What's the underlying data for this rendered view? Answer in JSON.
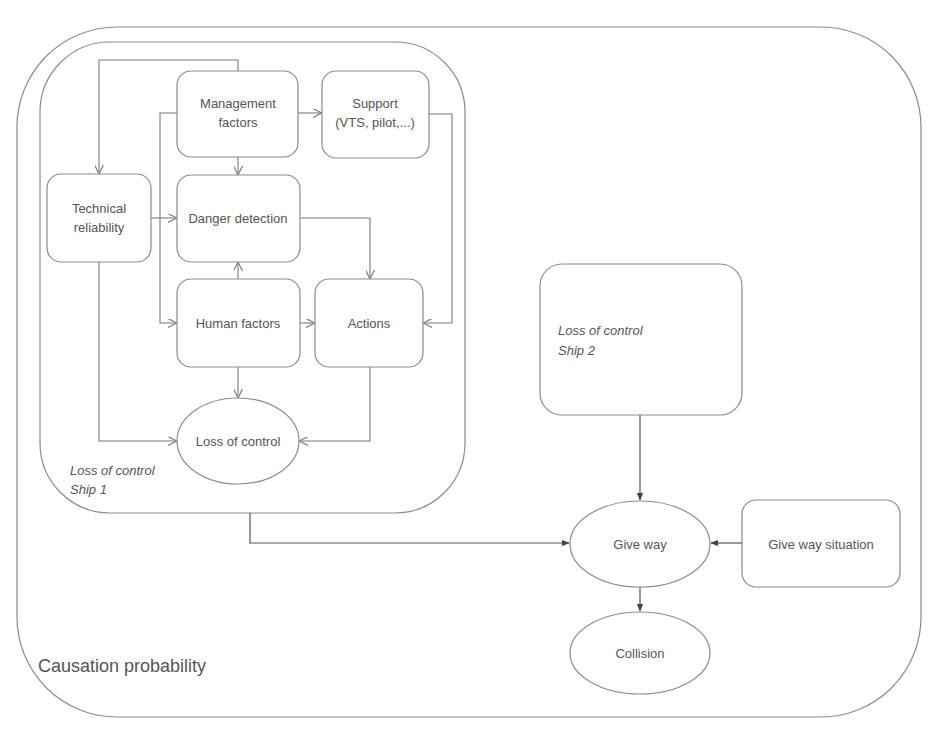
{
  "diagram": {
    "outer_container": {
      "label": "Causation probability"
    },
    "ship1_container": {
      "label_line1": "Loss of control",
      "label_line2": "Ship 1"
    },
    "ship2_box": {
      "label_line1": "Loss of control",
      "label_line2": "Ship 2"
    },
    "nodes": {
      "management": {
        "line1": "Management",
        "line2": "factors"
      },
      "support": {
        "line1": "Support",
        "line2": "(VTS, pilot,...)"
      },
      "technical": {
        "line1": "Technical",
        "line2": "reliability"
      },
      "danger": {
        "label": "Danger detection"
      },
      "human": {
        "label": "Human factors"
      },
      "actions": {
        "label": "Actions"
      },
      "loss_of_control": {
        "label": "Loss of control"
      },
      "give_way": {
        "label": "Give way"
      },
      "give_way_situation": {
        "label": "Give way situation"
      },
      "collision": {
        "label": "Collision"
      }
    },
    "edges": [
      {
        "from": "Management factors",
        "to": "Technical reliability"
      },
      {
        "from": "Management factors",
        "to": "Support (VTS, pilot,...)"
      },
      {
        "from": "Management factors",
        "to": "Danger detection"
      },
      {
        "from": "Management factors",
        "to": "Human factors"
      },
      {
        "from": "Technical reliability",
        "to": "Danger detection"
      },
      {
        "from": "Technical reliability",
        "to": "Loss of control"
      },
      {
        "from": "Human factors",
        "to": "Danger detection"
      },
      {
        "from": "Human factors",
        "to": "Actions"
      },
      {
        "from": "Human factors",
        "to": "Loss of control"
      },
      {
        "from": "Danger detection",
        "to": "Actions"
      },
      {
        "from": "Support (VTS, pilot,...)",
        "to": "Actions"
      },
      {
        "from": "Actions",
        "to": "Loss of control"
      },
      {
        "from": "Loss of control Ship 1",
        "to": "Give way"
      },
      {
        "from": "Loss of control Ship 2",
        "to": "Give way"
      },
      {
        "from": "Give way situation",
        "to": "Give way"
      },
      {
        "from": "Give way",
        "to": "Collision"
      }
    ],
    "colors": {
      "stroke": "#8c8c8c",
      "text": "#555555",
      "background": "#ffffff"
    }
  }
}
